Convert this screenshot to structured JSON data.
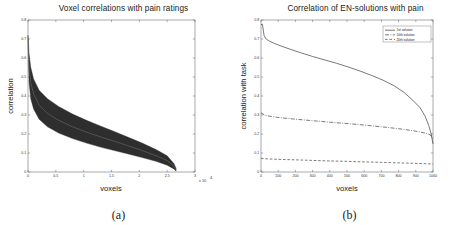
{
  "figure": {
    "panels": [
      {
        "caption": "(a)",
        "title": "Voxel correlations with pain ratings"
      },
      {
        "caption": "(b)",
        "title": "Correlation of EN-solutions  with pain"
      }
    ]
  },
  "chart_data": [
    {
      "type": "area",
      "title": "Voxel correlations with pain ratings",
      "xlabel": "voxels",
      "ylabel": "correlation",
      "xlim": [
        0,
        3
      ],
      "ylim": [
        0,
        0.8
      ],
      "x_exponent_label": "x 10",
      "x_exponent_power": "4",
      "xticks": [
        "0",
        "0.5",
        "1",
        "1.5",
        "2",
        "2.5",
        "3"
      ],
      "xtick_values": [
        0,
        0.5,
        1,
        1.5,
        2,
        2.5,
        3
      ],
      "yticks": [
        "0",
        "0.1",
        "0.2",
        "0.3",
        "0.4",
        "0.5",
        "0.6",
        "0.7",
        "0.8"
      ],
      "ytick_values": [
        0,
        0.1,
        0.2,
        0.3,
        0.4,
        0.5,
        0.6,
        0.7,
        0.8
      ],
      "grid": false,
      "legend": "none",
      "band_color": "#2e2e2e",
      "series": [
        {
          "name": "upper envelope",
          "x": [
            0.0,
            0.02,
            0.05,
            0.1,
            0.2,
            0.35,
            0.55,
            0.8,
            1.05,
            1.3,
            1.55,
            1.8,
            2.05,
            2.3,
            2.5,
            2.62,
            2.66
          ],
          "values": [
            0.72,
            0.62,
            0.55,
            0.49,
            0.43,
            0.385,
            0.345,
            0.305,
            0.272,
            0.242,
            0.213,
            0.183,
            0.152,
            0.118,
            0.085,
            0.045,
            0.02
          ]
        },
        {
          "name": "mean curve",
          "x": [
            0.0,
            0.02,
            0.05,
            0.1,
            0.2,
            0.35,
            0.55,
            0.8,
            1.05,
            1.3,
            1.55,
            1.8,
            2.05,
            2.3,
            2.5,
            2.62,
            2.66
          ],
          "values": [
            0.7,
            0.55,
            0.47,
            0.412,
            0.352,
            0.308,
            0.272,
            0.238,
            0.21,
            0.185,
            0.162,
            0.138,
            0.113,
            0.086,
            0.06,
            0.03,
            0.012
          ]
        },
        {
          "name": "lower envelope",
          "x": [
            0.0,
            0.02,
            0.05,
            0.1,
            0.2,
            0.35,
            0.55,
            0.8,
            1.05,
            1.3,
            1.55,
            1.8,
            2.05,
            2.3,
            2.5,
            2.62,
            2.66
          ],
          "values": [
            0.68,
            0.47,
            0.385,
            0.332,
            0.278,
            0.238,
            0.205,
            0.176,
            0.152,
            0.131,
            0.113,
            0.095,
            0.076,
            0.056,
            0.036,
            0.016,
            0.005
          ]
        }
      ]
    },
    {
      "type": "line",
      "title": "Correlation of EN-solutions  with pain",
      "xlabel": "voxels",
      "ylabel": "correlation with task",
      "xlim": [
        0,
        1000
      ],
      "ylim": [
        0,
        0.8
      ],
      "xticks": [
        "0",
        "100",
        "200",
        "300",
        "400",
        "500",
        "600",
        "700",
        "800",
        "900",
        "1000"
      ],
      "xtick_values": [
        0,
        100,
        200,
        300,
        400,
        500,
        600,
        700,
        800,
        900,
        1000
      ],
      "yticks": [
        "0",
        "0.1",
        "0.2",
        "0.3",
        "0.4",
        "0.5",
        "0.6",
        "0.7",
        "0.8"
      ],
      "ytick_values": [
        0,
        0.1,
        0.2,
        0.3,
        0.4,
        0.5,
        0.6,
        0.7,
        0.8
      ],
      "grid": false,
      "legend_position": "top-right",
      "legend": [
        "1st solution",
        "10th solution",
        "20th solution"
      ],
      "series": [
        {
          "name": "1st solution",
          "style": "solid",
          "x": [
            0,
            8,
            18,
            30,
            50,
            80,
            120,
            170,
            230,
            300,
            370,
            440,
            510,
            580,
            650,
            710,
            770,
            830,
            880,
            925,
            955,
            975,
            988,
            995,
            1000
          ],
          "values": [
            0.775,
            0.778,
            0.718,
            0.7,
            0.688,
            0.676,
            0.662,
            0.646,
            0.628,
            0.608,
            0.59,
            0.572,
            0.552,
            0.53,
            0.506,
            0.483,
            0.456,
            0.42,
            0.38,
            0.338,
            0.292,
            0.245,
            0.205,
            0.172,
            0.148
          ]
        },
        {
          "name": "10th solution",
          "style": "dash-dot",
          "x": [
            0,
            20,
            60,
            120,
            200,
            300,
            400,
            500,
            600,
            700,
            800,
            880,
            930,
            965,
            985,
            1000
          ],
          "values": [
            0.312,
            0.3,
            0.292,
            0.285,
            0.278,
            0.27,
            0.262,
            0.255,
            0.247,
            0.238,
            0.228,
            0.218,
            0.21,
            0.202,
            0.195,
            0.175
          ]
        },
        {
          "name": "20th solution",
          "style": "dashed",
          "x": [
            0,
            20,
            60,
            120,
            200,
            300,
            400,
            500,
            600,
            700,
            800,
            880,
            940,
            1000
          ],
          "values": [
            0.072,
            0.07,
            0.068,
            0.066,
            0.064,
            0.061,
            0.058,
            0.056,
            0.053,
            0.051,
            0.048,
            0.046,
            0.044,
            0.042
          ]
        }
      ]
    }
  ]
}
